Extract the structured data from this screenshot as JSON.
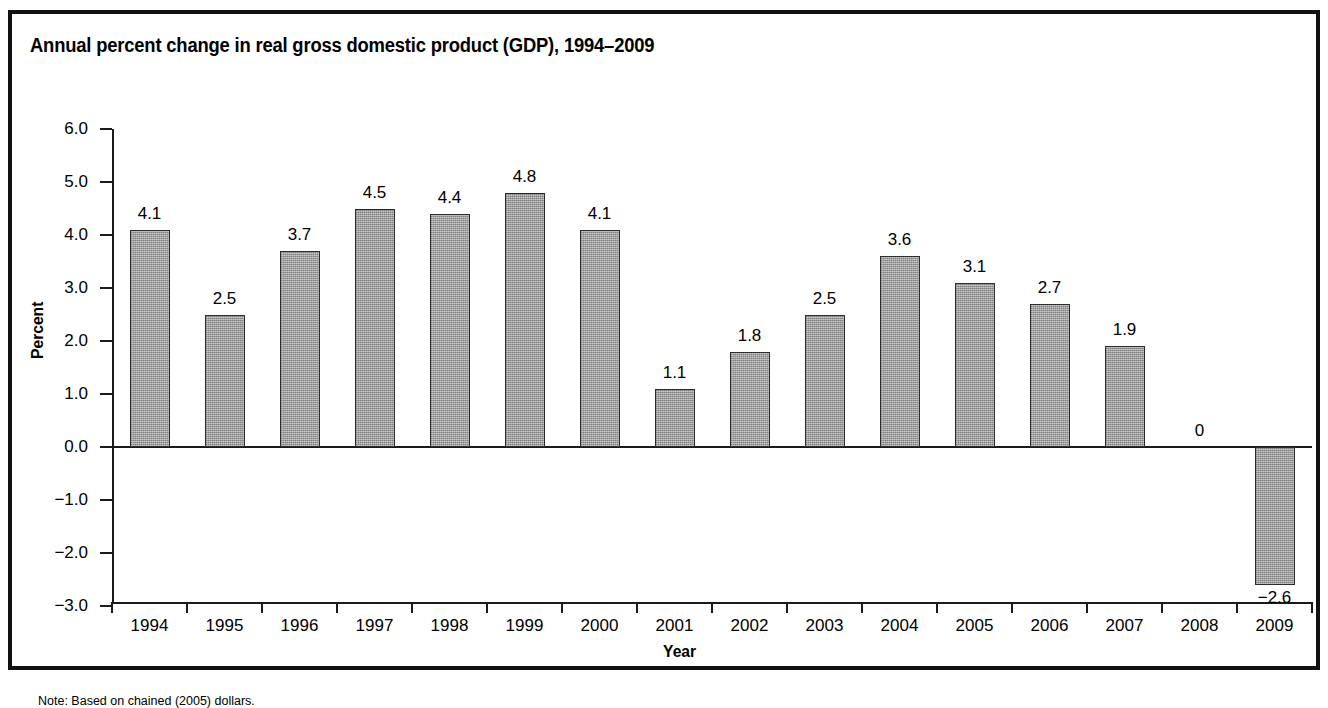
{
  "figure": {
    "title": "Annual percent change in real gross domestic product (GDP), 1994–2009",
    "note": "Note: Based on chained (2005) dollars."
  },
  "chart_data": {
    "type": "bar",
    "title": "Annual percent change in real gross domestic product (GDP), 1994–2009",
    "xlabel": "Year",
    "ylabel": "Percent",
    "ylim": [
      -3.0,
      6.0
    ],
    "grid": false,
    "legend": "none",
    "bar_color": "#9d9d9d",
    "bar_edge_color": "#2b2b2b",
    "ytick_labels": [
      "6.0",
      "5.0",
      "4.0",
      "3.0",
      "2.0",
      "1.0",
      "0.0",
      "−1.0",
      "−2.0",
      "−3.0"
    ],
    "ytick_values": [
      6.0,
      5.0,
      4.0,
      3.0,
      2.0,
      1.0,
      0.0,
      -1.0,
      -2.0,
      -3.0
    ],
    "categories": [
      "1994",
      "1995",
      "1996",
      "1997",
      "1998",
      "1999",
      "2000",
      "2001",
      "2002",
      "2003",
      "2004",
      "2005",
      "2006",
      "2007",
      "2008",
      "2009"
    ],
    "values": [
      4.1,
      2.5,
      3.7,
      4.5,
      4.4,
      4.8,
      4.1,
      1.1,
      1.8,
      2.5,
      3.6,
      3.1,
      2.7,
      1.9,
      0,
      -2.6
    ],
    "value_labels": [
      "4.1",
      "2.5",
      "3.7",
      "4.5",
      "4.4",
      "4.8",
      "4.1",
      "1.1",
      "1.8",
      "2.5",
      "3.6",
      "3.1",
      "2.7",
      "1.9",
      "0",
      "−2.6"
    ]
  }
}
